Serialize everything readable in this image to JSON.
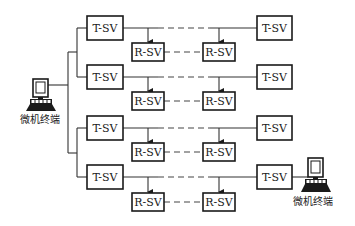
{
  "diagram": {
    "type": "network-topology",
    "node_types": {
      "transmitter": "T-SV",
      "receiver": "R-SV"
    },
    "terminals": [
      {
        "id": "left-terminal",
        "label": "微机终端"
      },
      {
        "id": "right-terminal",
        "label": "微机终端"
      }
    ],
    "rows": [
      {
        "left_tx": "T-SV",
        "rx1": "R-SV",
        "rx2": "R-SV",
        "right_tx": "T-SV"
      },
      {
        "left_tx": "T-SV",
        "rx1": "R-SV",
        "rx2": "R-SV",
        "right_tx": "T-SV"
      },
      {
        "left_tx": "T-SV",
        "rx1": "R-SV",
        "rx2": "R-SV",
        "right_tx": "T-SV"
      },
      {
        "left_tx": "T-SV",
        "rx1": "R-SV",
        "rx2": "R-SV",
        "right_tx": "T-SV"
      }
    ],
    "colors": {
      "stroke": "#1a1a1a",
      "background": "#ffffff",
      "text": "#222222"
    }
  }
}
